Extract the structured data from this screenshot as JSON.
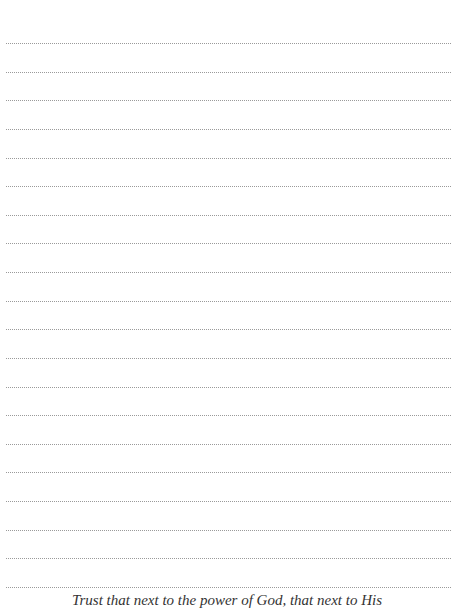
{
  "page": {
    "type": "lined-notes-page",
    "rule_count": 20,
    "rule_color": "#9a9a9a",
    "footer_quote": "Trust that next to the power of God, that next to His"
  }
}
